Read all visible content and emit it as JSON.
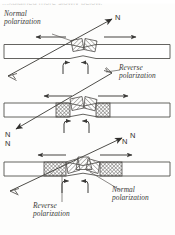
{
  "figure": {
    "caption_fragment_top": "...xplained more slowly below.",
    "panel_count": 3
  },
  "labels": {
    "normal_polarization_top": "Normal\npolarization",
    "reverse_polarization_middle": "Reverse\npolarization",
    "normal_polarization_bottom": "Normal\npolarization",
    "reverse_polarization_bottom": "Reverse\npolarization",
    "north_top_right": "N",
    "north_middle_left": "N",
    "north_middle_right": "N",
    "north_bottom_left": "N",
    "north_bottom_right": "N"
  },
  "colors": {
    "ink": "#3b3a38",
    "slab_outline": "#54524f",
    "slab_fill": "#ffffff",
    "hatch_stroke": "#6b6966",
    "background": "#fdfdfc",
    "faint_text": "#8d8b88"
  },
  "panels": [
    {
      "index": 1,
      "name": "panel-stage-1",
      "slab_y": 45,
      "polarity_label": "Normal\npolarization",
      "block_count": 2,
      "spread_arrows": [
        "left",
        "right"
      ],
      "upwelling_hooks": 2,
      "field_arrow_direction": "up-right",
      "field_arrow_label": "N"
    },
    {
      "index": 2,
      "name": "panel-stage-2",
      "slab_y": 103,
      "polarity_label": "Reverse\npolarization",
      "block_count": 4,
      "spread_arrows": [
        "left",
        "right"
      ],
      "upwelling_hooks": 2,
      "field_arrow_direction": "down-left",
      "field_arrow_label": "N"
    },
    {
      "index": 3,
      "name": "panel-stage-3",
      "slab_y": 162,
      "polarity_label": "Normal\npolarization",
      "secondary_label": "Reverse\npolarization",
      "block_count": 6,
      "spread_arrows": [
        "left",
        "right"
      ],
      "upwelling_hooks": 2,
      "field_arrow_direction": "up-right",
      "field_arrow_label": "N"
    }
  ]
}
